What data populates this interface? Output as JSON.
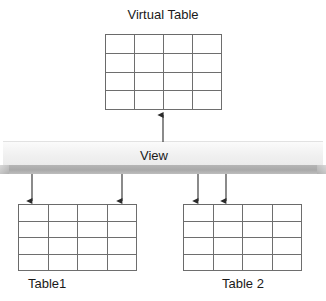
{
  "diagram": {
    "title": "Virtual Table",
    "view_bar_label": "View",
    "table1_label": "Table1",
    "table2_label": "Table 2",
    "colors": {
      "background": "#ffffff",
      "text": "#1a1a1a",
      "grid_line": "#6e6e6e",
      "arrow": "#2b2b2b",
      "bar_top": "#f4f4f4",
      "bar_front": "#a9a9a9"
    },
    "virtual_table": {
      "name": "Virtual Table",
      "columns": 4,
      "rows": 4,
      "cells": [
        [
          "",
          "",
          "",
          ""
        ],
        [
          "",
          "",
          "",
          ""
        ],
        [
          "",
          "",
          "",
          ""
        ],
        [
          "",
          "",
          "",
          ""
        ]
      ]
    },
    "table1": {
      "name": "Table1",
      "columns": 4,
      "rows": 4,
      "cells": [
        [
          "",
          "",
          "",
          ""
        ],
        [
          "",
          "",
          "",
          ""
        ],
        [
          "",
          "",
          "",
          ""
        ],
        [
          "",
          "",
          "",
          ""
        ]
      ]
    },
    "table2": {
      "name": "Table 2",
      "columns": 4,
      "rows": 4,
      "cells": [
        [
          "",
          "",
          "",
          ""
        ],
        [
          "",
          "",
          "",
          ""
        ],
        [
          "",
          "",
          "",
          ""
        ],
        [
          "",
          "",
          "",
          ""
        ]
      ]
    },
    "arrows": [
      {
        "id": "view-to-virtual-table",
        "direction": "up",
        "from": "View",
        "to": "Virtual Table"
      },
      {
        "id": "view-to-table1-left",
        "direction": "down",
        "from": "View",
        "to": "Table1"
      },
      {
        "id": "view-to-table1-right",
        "direction": "down",
        "from": "View",
        "to": "Table1"
      },
      {
        "id": "view-to-table2-left",
        "direction": "down",
        "from": "View",
        "to": "Table 2"
      },
      {
        "id": "view-to-table2-right",
        "direction": "down",
        "from": "View",
        "to": "Table 2"
      }
    ]
  }
}
